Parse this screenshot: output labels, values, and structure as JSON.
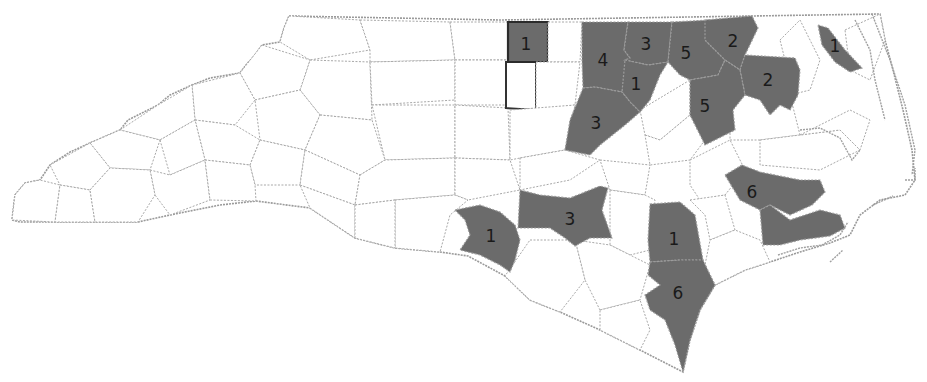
{
  "map": {
    "region": "North Carolina counties",
    "fill_highlight": "#6b6b6b",
    "fill_default": "#ffffff",
    "border_color": "#a8a8a8",
    "selected_border_color": "#2b2b2b"
  },
  "labels": [
    {
      "id": "c-north-selected",
      "value": "1",
      "x": 526,
      "y": 45
    },
    {
      "id": "c-granville",
      "value": "4",
      "x": 603,
      "y": 61
    },
    {
      "id": "c-vance",
      "value": "3",
      "x": 646,
      "y": 45
    },
    {
      "id": "c-warren",
      "value": "5",
      "x": 686,
      "y": 54
    },
    {
      "id": "c-northampton",
      "value": "2",
      "x": 733,
      "y": 42
    },
    {
      "id": "c-franklin",
      "value": "1",
      "x": 636,
      "y": 85
    },
    {
      "id": "c-bertie",
      "value": "2",
      "x": 768,
      "y": 81
    },
    {
      "id": "c-pasquotank",
      "value": "1",
      "x": 835,
      "y": 47
    },
    {
      "id": "c-wake",
      "value": "3",
      "x": 596,
      "y": 124
    },
    {
      "id": "c-edgecombe",
      "value": "5",
      "x": 705,
      "y": 107
    },
    {
      "id": "c-craven-pamlico",
      "value": "6",
      "x": 752,
      "y": 193
    },
    {
      "id": "c-moore",
      "value": "3",
      "x": 570,
      "y": 220
    },
    {
      "id": "c-anson",
      "value": "1",
      "x": 491,
      "y": 237
    },
    {
      "id": "c-duplin",
      "value": "1",
      "x": 674,
      "y": 240
    },
    {
      "id": "c-pender",
      "value": "6",
      "x": 678,
      "y": 294
    }
  ]
}
